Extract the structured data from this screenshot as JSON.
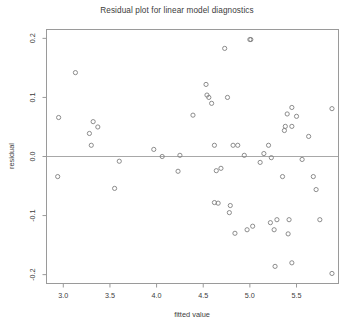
{
  "chart_data": {
    "type": "scatter",
    "title": "Residual plot for linear model diagnostics",
    "xlabel": "fitted value",
    "ylabel": "residual",
    "xlim": [
      2.82,
      5.95
    ],
    "ylim": [
      -0.215,
      0.215
    ],
    "xticks": [
      3.0,
      3.5,
      4.0,
      4.5,
      5.0,
      5.5
    ],
    "xtick_labels": [
      "3.0",
      "3.5",
      "4.0",
      "4.5",
      "5.0",
      "5.5"
    ],
    "yticks": [
      0.2,
      0.1,
      0.0,
      -0.1,
      -0.2
    ],
    "ytick_labels": [
      "0.2",
      "0.1",
      "0.0",
      "-0.1",
      "-0.2"
    ],
    "grid": false,
    "legend": null,
    "reference_line": {
      "type": "horizontal",
      "y": 0.0
    },
    "marker": "open-circle",
    "marker_color": "#808080",
    "frame_color": "#9a9a9a",
    "x": [
      3.13,
      2.95,
      3.32,
      3.37,
      3.28,
      3.3,
      4.73,
      4.53,
      4.54,
      4.56,
      4.76,
      4.59,
      5.01,
      5.0,
      5.88,
      5.45,
      5.4,
      5.5,
      5.38,
      5.45,
      5.37,
      5.63,
      4.39,
      3.97,
      4.25,
      4.62,
      4.82,
      4.87,
      4.94,
      5.2,
      5.15,
      5.23,
      5.56,
      4.06,
      3.6,
      2.94,
      3.55,
      4.23,
      4.64,
      4.69,
      4.62,
      4.66,
      4.79,
      4.78,
      5.11,
      5.35,
      5.68,
      5.71,
      4.97,
      5.42,
      5.29,
      5.75,
      5.26,
      5.41,
      5.45,
      5.27,
      4.84,
      5.22,
      5.03,
      5.88
    ],
    "y": [
      0.142,
      0.066,
      0.059,
      0.05,
      0.039,
      0.019,
      0.183,
      0.122,
      0.104,
      0.1,
      0.1,
      0.09,
      0.198,
      0.198,
      0.081,
      0.083,
      0.072,
      0.068,
      0.051,
      0.051,
      0.044,
      0.034,
      0.07,
      0.012,
      0.002,
      0.019,
      0.019,
      0.019,
      0.002,
      0.019,
      0.005,
      -0.002,
      -0.005,
      0.0,
      -0.008,
      -0.034,
      -0.054,
      -0.025,
      -0.024,
      -0.02,
      -0.078,
      -0.079,
      -0.083,
      -0.095,
      -0.01,
      -0.034,
      -0.034,
      -0.056,
      -0.124,
      -0.107,
      -0.107,
      -0.107,
      -0.124,
      -0.131,
      -0.18,
      -0.186,
      -0.13,
      -0.112,
      -0.118,
      -0.198
    ]
  }
}
